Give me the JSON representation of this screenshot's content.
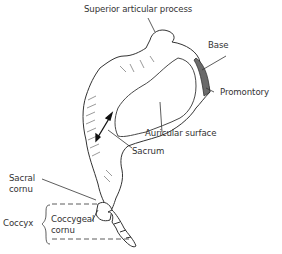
{
  "diagram": {
    "colors": {
      "line": "#333333",
      "shade": "#555555",
      "fill": "#ffffff",
      "dark_fill": "#6a6a6a"
    },
    "labels": {
      "superior_articular_process": "Superior articular process",
      "base": "Base",
      "promontory": "Promontory",
      "auricular_surface": "Auricular surface",
      "sacrum": "Sacrum",
      "sacral_cornu_line1": "Sacral",
      "sacral_cornu_line2": "cornu",
      "coccyx": "Coccyx",
      "coccygeal_cornu_line1": "Coccygeal",
      "coccygeal_cornu_line2": "cornu"
    }
  }
}
